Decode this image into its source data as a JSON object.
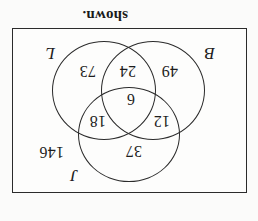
{
  "page": {
    "orientation": "upside-down",
    "rotation_degrees": 180,
    "background_color": "#fbfbfa",
    "ink_color": "#1d1d1d",
    "caption": "shown."
  },
  "diagram": {
    "type": "venn-3-set",
    "frame": {
      "border_color": "#2b2b2b",
      "fill_color": "#fdfdfc"
    },
    "sets": [
      {
        "id": "J",
        "label": "J",
        "position": "top"
      },
      {
        "id": "B",
        "label": "B",
        "position": "bottom-left"
      },
      {
        "id": "L",
        "label": "L",
        "position": "bottom-right"
      }
    ],
    "regions": [
      {
        "id": "j-only",
        "label": "J only",
        "value": "37"
      },
      {
        "id": "jb",
        "label": "J and B only",
        "value": "12"
      },
      {
        "id": "jl",
        "label": "J and L only",
        "value": "18"
      },
      {
        "id": "jbl",
        "label": "J and B and L",
        "value": "6"
      },
      {
        "id": "b-only",
        "label": "B only",
        "value": "49"
      },
      {
        "id": "bl",
        "label": "B and L only",
        "value": "24"
      },
      {
        "id": "l-only",
        "label": "L only",
        "value": "73"
      },
      {
        "id": "outside",
        "label": "outside all sets",
        "value": "146"
      }
    ]
  }
}
